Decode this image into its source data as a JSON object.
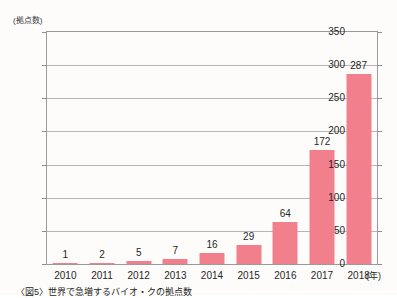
{
  "chart_data": {
    "type": "bar",
    "title": "",
    "categories": [
      "2010",
      "2011",
      "2012",
      "2013",
      "2014",
      "2015",
      "2016",
      "2017",
      "2018"
    ],
    "values": [
      1,
      2,
      5,
      7,
      16,
      29,
      64,
      172,
      287
    ],
    "xlabel": "(年)",
    "ylabel": "(拠点数)",
    "ylim": [
      0,
      350
    ],
    "yticks": [
      0,
      50,
      100,
      150,
      200,
      250,
      300,
      350
    ],
    "ytick_labels": [
      "0",
      "50",
      "100",
      "150",
      "200",
      "250",
      "300",
      "350"
    ],
    "grid": true,
    "legend": false,
    "bar_color": "#f2808c",
    "grid_color": "#b5b5b5",
    "axis_color": "#9a9a9a",
    "data_labels": [
      "1",
      "2",
      "5",
      "7",
      "16",
      "29",
      "64",
      "172",
      "287"
    ]
  },
  "caption": {
    "text": "〈図5〉世界で急増するバイオ・クの拠点数"
  }
}
